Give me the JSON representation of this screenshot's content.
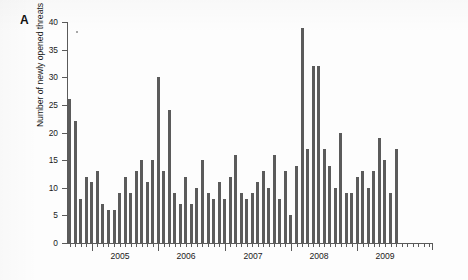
{
  "figure": {
    "panel_label": "A",
    "ylabel": "Number of newly opened threats"
  },
  "chart_data": {
    "type": "bar",
    "title": "",
    "xlabel": "",
    "ylabel": "Number of newly opened threats",
    "ylim": [
      0,
      40
    ],
    "yticks": [
      0,
      5,
      10,
      15,
      20,
      25,
      30,
      35,
      40
    ],
    "ytick_labels": [
      "0",
      "5",
      "10",
      "15",
      "20",
      "25",
      "30",
      "35",
      "40"
    ],
    "grid": false,
    "legend": null,
    "bar_color": "#5b5b5b",
    "axis_color": "#5a5a5a",
    "x_axis_note": "monthly bars; major tick + label at each year start",
    "year_labels": [
      "2005",
      "2006",
      "2007",
      "2008",
      "2009"
    ],
    "categories": [
      "2004-09",
      "2004-10",
      "2004-11",
      "2004-12",
      "2005-01",
      "2005-02",
      "2005-03",
      "2005-04",
      "2005-05",
      "2005-06",
      "2005-07",
      "2005-08",
      "2005-09",
      "2005-10",
      "2005-11",
      "2005-12",
      "2006-01",
      "2006-02",
      "2006-03",
      "2006-04",
      "2006-05",
      "2006-06",
      "2006-07",
      "2006-08",
      "2006-09",
      "2006-10",
      "2006-11",
      "2006-12",
      "2007-01",
      "2007-02",
      "2007-03",
      "2007-04",
      "2007-05",
      "2007-06",
      "2007-07",
      "2007-08",
      "2007-09",
      "2007-10",
      "2007-11",
      "2007-12",
      "2008-01",
      "2008-02",
      "2008-03",
      "2008-04",
      "2008-05",
      "2008-06",
      "2008-07",
      "2008-08",
      "2008-09",
      "2008-10",
      "2008-11",
      "2008-12",
      "2009-01",
      "2009-02",
      "2009-03",
      "2009-04",
      "2009-05",
      "2009-06",
      "2009-07",
      "2009-08",
      "2009-09",
      "2009-10",
      "2009-11",
      "2009-12",
      "2010-01",
      "2010-02"
    ],
    "values": [
      26,
      22,
      8,
      12,
      11,
      13,
      7,
      6,
      6,
      9,
      12,
      9,
      13,
      15,
      11,
      15,
      30,
      13,
      24,
      9,
      7,
      12,
      7,
      10,
      15,
      9,
      8,
      11,
      8,
      12,
      16,
      9,
      8,
      9,
      11,
      13,
      10,
      16,
      8,
      13,
      5,
      14,
      39,
      17,
      32,
      32,
      17,
      14,
      10,
      20,
      9,
      9,
      12,
      13,
      10,
      13,
      19,
      15,
      9,
      17,
      0,
      0,
      0,
      0,
      0,
      0
    ]
  }
}
